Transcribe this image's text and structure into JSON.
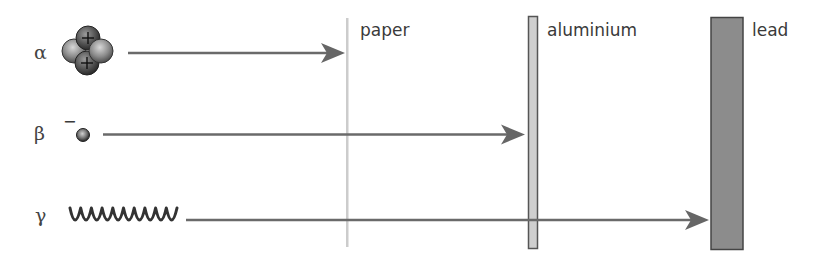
{
  "diagram": {
    "particles": [
      {
        "id": "alpha",
        "symbol": "α",
        "charge_mark": "",
        "icon": "alpha-particle-icon",
        "stopped_by": "paper"
      },
      {
        "id": "beta",
        "symbol": "β",
        "charge_mark": "−",
        "icon": "electron-icon",
        "stopped_by": "aluminium"
      },
      {
        "id": "gamma",
        "symbol": "γ",
        "charge_mark": "",
        "icon": "wave-icon",
        "stopped_by": "lead"
      }
    ],
    "barriers": [
      {
        "id": "paper",
        "label": "paper",
        "color": "#cccccc"
      },
      {
        "id": "aluminium",
        "label": "aluminium",
        "fill": "#cfcfcf",
        "stroke": "#555555"
      },
      {
        "id": "lead",
        "label": "lead",
        "fill": "#8c8c8c",
        "stroke": "#444444"
      }
    ],
    "colors": {
      "arrow": "#6a6a6a",
      "text": "#3a3a3a",
      "wave": "#333333",
      "proton": "#555555",
      "neutron": "#8a8a8a"
    }
  }
}
